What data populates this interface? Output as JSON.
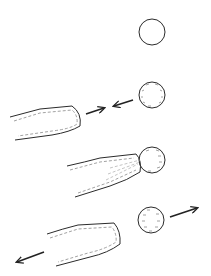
{
  "diagram": {
    "title": "",
    "colors": {
      "stroke": "#2b2b2b",
      "dash": "#8a8a8a",
      "arrow": "#222222",
      "background": "#ffffff"
    },
    "stages": [
      {
        "id": "stage-1",
        "description": "isolated cell",
        "cell": {
          "cx": 152,
          "cy": 32,
          "r": 13,
          "filled": false
        },
        "pipette": null,
        "arrows": []
      },
      {
        "id": "stage-2",
        "description": "pipette and cell approach each other",
        "cell": {
          "cx": 152,
          "cy": 95,
          "r": 13,
          "filled": true
        },
        "pipette": {
          "tip_x": 82,
          "top_y": 105,
          "bottom_y": 142
        },
        "arrows": [
          {
            "direction": "right",
            "x1": 86,
            "y1": 114,
            "x2": 104,
            "y2": 108
          },
          {
            "direction": "left",
            "x1": 133,
            "y1": 100,
            "x2": 114,
            "y2": 106
          }
        ]
      },
      {
        "id": "stage-3",
        "description": "pipette in contact with cell",
        "cell": {
          "cx": 152,
          "cy": 160,
          "r": 13,
          "filled": true
        },
        "pipette": {
          "tip_x": 140,
          "top_y": 155,
          "bottom_y": 197
        },
        "arrows": []
      },
      {
        "id": "stage-4",
        "description": "pipette and cell separate",
        "cell": {
          "cx": 151,
          "cy": 220,
          "r": 13,
          "filled": true
        },
        "pipette": {
          "tip_x": 120,
          "top_y": 223,
          "bottom_y": 266
        },
        "arrows": [
          {
            "direction": "right",
            "x1": 170,
            "y1": 217,
            "x2": 197,
            "y2": 208
          },
          {
            "direction": "left",
            "x1": 44,
            "y1": 252,
            "x2": 17,
            "y2": 262
          }
        ]
      }
    ]
  }
}
